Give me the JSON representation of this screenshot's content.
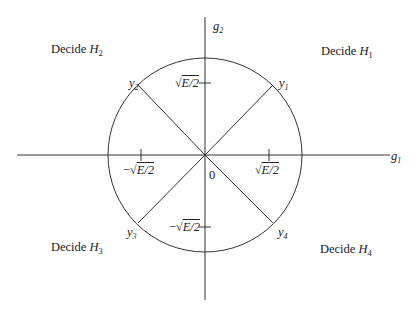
{
  "diagram": {
    "type": "signal-space decision regions (QPSK)",
    "axes": {
      "horizontal": {
        "label": "g",
        "subscript": "1"
      },
      "vertical": {
        "label": "g",
        "subscript": "2"
      },
      "origin_label": "0"
    },
    "ticks": {
      "pos_x": {
        "prefix": "",
        "radicand": "E/2"
      },
      "neg_x": {
        "prefix": "−",
        "radicand": "E/2"
      },
      "pos_y": {
        "prefix": "",
        "radicand": "E/2"
      },
      "neg_y": {
        "prefix": "−",
        "radicand": "E/2"
      }
    },
    "signal_points": [
      {
        "name": "y",
        "subscript": "1",
        "quadrant": "I"
      },
      {
        "name": "y",
        "subscript": "2",
        "quadrant": "II"
      },
      {
        "name": "y",
        "subscript": "3",
        "quadrant": "III"
      },
      {
        "name": "y",
        "subscript": "4",
        "quadrant": "IV"
      }
    ],
    "regions": [
      {
        "prefix": "Decide ",
        "hyp": "H",
        "subscript": "1"
      },
      {
        "prefix": "Decide ",
        "hyp": "H",
        "subscript": "2"
      },
      {
        "prefix": "Decide ",
        "hyp": "H",
        "subscript": "3"
      },
      {
        "prefix": "Decide ",
        "hyp": "H",
        "subscript": "4"
      }
    ],
    "colors": {
      "line": "#333333",
      "background": "#ffffff"
    }
  }
}
